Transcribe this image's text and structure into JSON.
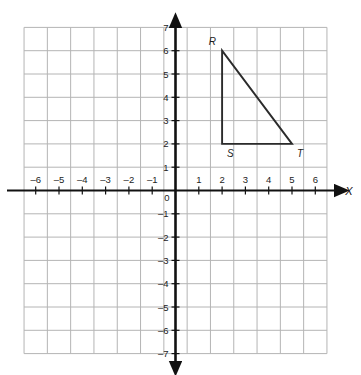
{
  "chart_data": {
    "type": "scatter",
    "title": "",
    "subtitle": "",
    "xlabel": "X",
    "ylabel": "Y",
    "xlim": [
      -6.5,
      6.5
    ],
    "ylim": [
      -7,
      7
    ],
    "grid": true,
    "legend": "none",
    "origin_label": "0",
    "x_ticks": [
      -6,
      -5,
      -4,
      -3,
      -2,
      -1,
      1,
      2,
      3,
      4,
      5,
      6
    ],
    "x_tick_labels": [
      "–6",
      "–5",
      "–4",
      "–3",
      "–2",
      "–1",
      "1",
      "2",
      "3",
      "4",
      "5",
      "6"
    ],
    "y_ticks": [
      7,
      6,
      5,
      4,
      3,
      2,
      1,
      -1,
      -2,
      -3,
      -4,
      -5,
      -6,
      -7
    ],
    "y_tick_labels": [
      "7",
      "6",
      "5",
      "4",
      "3",
      "2",
      "1",
      "–1",
      "–2",
      "–3",
      "–4",
      "–5",
      "–6",
      "–7"
    ],
    "shapes": [
      {
        "name": "triangle-rst",
        "type": "polygon",
        "closed": true,
        "stroke": "#2b2b2b",
        "fill": "none",
        "vertices": [
          {
            "label": "R",
            "x": 2,
            "y": 6,
            "label_position": "above-left"
          },
          {
            "label": "S",
            "x": 2,
            "y": 2,
            "label_position": "below-right"
          },
          {
            "label": "T",
            "x": 5,
            "y": 2,
            "label_position": "below-right"
          }
        ]
      }
    ]
  },
  "axes": {
    "x_axis_name": "X",
    "y_axis_name": "Y",
    "origin": "0"
  },
  "vertices": {
    "r": {
      "label": "R",
      "x": 2,
      "y": 6
    },
    "s": {
      "label": "S",
      "x": 2,
      "y": 2
    },
    "t": {
      "label": "T",
      "x": 5,
      "y": 2
    }
  },
  "colors": {
    "grid_line": "#b4b4b4",
    "axis_line": "#111111",
    "shape_stroke": "#2b2b2b",
    "text": "#1c1c1c",
    "background": "#ffffff"
  }
}
